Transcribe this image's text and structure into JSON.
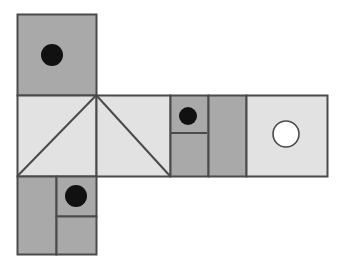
{
  "figure": {
    "width": 337,
    "height": 274,
    "background_color": "#ffffff"
  },
  "palette": {
    "mid_gray": "#a9a9a9",
    "light_gray": "#e2e2e2",
    "outline": "#4a4a4a",
    "dot_black": "#111111",
    "dot_white": "#ffffff",
    "background": "#ffffff"
  },
  "faces": [
    {
      "id": "top-face",
      "name": "top-square",
      "fill": "mid_gray",
      "x": 17,
      "y": 14,
      "w": 79,
      "h": 81,
      "marks": [
        {
          "type": "filled-circle",
          "cx": 52,
          "cy": 55,
          "r": 11,
          "fill": "dot_black"
        }
      ]
    },
    {
      "id": "mid-face-1",
      "name": "left-triangle-square",
      "fill": "light_gray",
      "x": 17,
      "y": 95,
      "w": 79,
      "h": 81,
      "diagonal": "bottom-left-to-top-right"
    },
    {
      "id": "mid-face-2",
      "name": "right-triangle-square",
      "fill": "light_gray",
      "x": 96,
      "y": 95,
      "w": 74,
      "h": 81,
      "diagonal": "top-left-to-bottom-right"
    },
    {
      "id": "mid-face-3",
      "name": "split-dot-panel",
      "fill": "mid_gray",
      "x": 170,
      "y": 95,
      "w": 38,
      "h": 81,
      "divider": {
        "type": "horizontal",
        "y": 133
      },
      "marks": [
        {
          "type": "filled-circle",
          "cx": 188,
          "cy": 116,
          "r": 9,
          "fill": "dot_black"
        }
      ]
    },
    {
      "id": "mid-face-4",
      "name": "plain-gray-panel",
      "fill": "mid_gray",
      "x": 208,
      "y": 95,
      "w": 38,
      "h": 81
    },
    {
      "id": "mid-face-5",
      "name": "hole-square",
      "fill": "light_gray",
      "x": 246,
      "y": 95,
      "w": 81,
      "h": 81,
      "marks": [
        {
          "type": "open-circle",
          "cx": 286,
          "cy": 134,
          "r": 13,
          "fill": "dot_white"
        }
      ]
    },
    {
      "id": "bottom-face-left",
      "name": "bottom-left-panel",
      "fill": "mid_gray",
      "x": 17,
      "y": 176,
      "w": 39,
      "h": 78
    },
    {
      "id": "bottom-face-right-top",
      "name": "bottom-right-dot-panel",
      "fill": "mid_gray",
      "x": 56,
      "y": 176,
      "w": 40,
      "h": 40,
      "marks": [
        {
          "type": "filled-circle",
          "cx": 76,
          "cy": 196,
          "r": 11,
          "fill": "dot_black"
        }
      ]
    },
    {
      "id": "bottom-face-right-bottom",
      "name": "bottom-right-plain-panel",
      "fill": "mid_gray",
      "x": 56,
      "y": 216,
      "w": 40,
      "h": 38
    }
  ],
  "chart_data": {
    "type": "diagram",
    "cell_size": 80,
    "counts": {
      "total_faces": 9,
      "mid_gray_faces": 6,
      "light_gray_faces": 3,
      "black_dots": 3,
      "white_circles": 1,
      "diagonals": 2
    },
    "annotations": [
      "Top square: mid gray with one black dot",
      "Middle row left square: light gray with diagonal from bottom-left to top-right",
      "Middle row second square: light gray with diagonal from top-left to bottom-right",
      "Middle row third panel: mid gray, split horizontally, black dot in upper half",
      "Middle row fourth panel: plain mid gray",
      "Middle row fifth square: light gray with white open circle",
      "Bottom square left column: plain mid gray",
      "Bottom square right column: split horizontally, black dot in upper half"
    ]
  }
}
